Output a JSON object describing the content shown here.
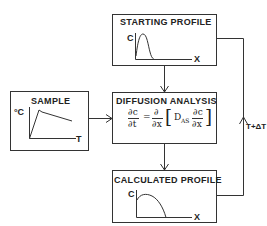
{
  "diagram": {
    "boxes": {
      "starting_profile": {
        "title": "STARTING PROFILE",
        "y_axis": "C",
        "x_axis": "X"
      },
      "sample": {
        "title": "SAMPLE",
        "y_axis": "°C",
        "x_axis": "T"
      },
      "diffusion_analysis": {
        "title": "DIFFUSION ANALYSIS",
        "equation": {
          "lhs_num": "∂c",
          "lhs_den": "∂t",
          "equals": "=",
          "op_num": "∂",
          "op_den": "∂x",
          "bracket_open": "[",
          "coefficient": "D",
          "coefficient_sub": "AS",
          "rhs_num": "∂c",
          "rhs_den": "∂x",
          "bracket_close": "]"
        }
      },
      "calculated_profile": {
        "title": "CALCULATED PROFILE",
        "y_axis": "C",
        "x_axis": "X"
      }
    },
    "loop_label": "T+ΔT",
    "edges": [
      {
        "from": "starting_profile",
        "to": "diffusion_analysis"
      },
      {
        "from": "sample",
        "to": "diffusion_analysis"
      },
      {
        "from": "diffusion_analysis",
        "to": "calculated_profile"
      },
      {
        "from": "calculated_profile",
        "to": "starting_profile",
        "label": "T+ΔT"
      }
    ]
  }
}
